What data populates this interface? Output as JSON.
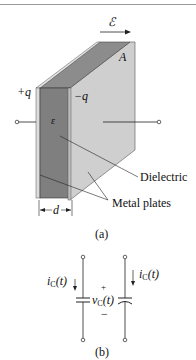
{
  "figure_a": {
    "field_symbol": "ℰ",
    "area_label": "A",
    "positive_charge": "+q",
    "negative_charge": "−q",
    "permittivity": "ε",
    "dielectric_label": "Dielectric",
    "plates_label": "Metal plates",
    "separation_label": "d",
    "caption": "(a)"
  },
  "figure_b": {
    "current_left": {
      "main": "i",
      "sub": "C",
      "arg": "(t)"
    },
    "current_right": {
      "main": "i",
      "sub": "C",
      "arg": "(t)"
    },
    "voltage": {
      "main": "v",
      "sub": "C",
      "arg": "(t)"
    },
    "plus": "+",
    "minus": "−",
    "caption": "(b)"
  },
  "colors": {
    "dielectric": "#7f7f7f",
    "plate": "#c9c9c9",
    "plate_edge": "#e6e6e6",
    "line": "#222222"
  }
}
